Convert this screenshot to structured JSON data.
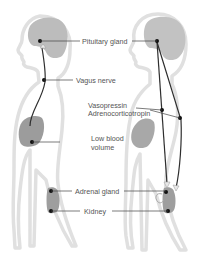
{
  "diagram": {
    "labels": {
      "pituitary": "Pituitary gland",
      "vagus": "Vagus nerve",
      "vasopressin": "Vasopressin",
      "adrenocorticotropin": "Adrenocorticotropin",
      "low_blood_1": "Low blood",
      "low_blood_2": "volume",
      "adrenal": "Adrenal gland",
      "kidney": "Kidney"
    },
    "colors": {
      "body_outline": "#e2e2e2",
      "body_fill": "#ffffff",
      "brain": "#b9b9b9",
      "organ": "#9a9a9a",
      "line": "#2e2e2e",
      "leader": "#444444",
      "text": "#555555"
    }
  }
}
